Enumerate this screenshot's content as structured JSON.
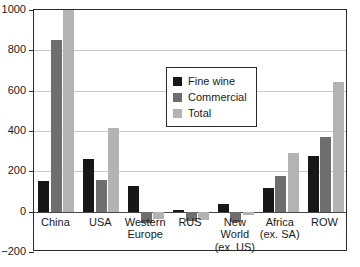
{
  "chart_data": {
    "type": "bar",
    "title": "",
    "subtitle": "",
    "xlabel": "",
    "ylabel": "",
    "ylim": [
      -200,
      1000
    ],
    "yticks": [
      1000,
      800,
      600,
      400,
      200,
      0,
      -200
    ],
    "ytick_labels": [
      "1000",
      "800",
      "600",
      "400",
      "200",
      "0",
      "−200"
    ],
    "grid": true,
    "grid_axis": "y",
    "legend_position": "upper center",
    "categories": [
      "China",
      "USA",
      "Western\nEurope",
      "RUS",
      "New\nWorld\n(ex. US)",
      "Africa\n(ex. SA)",
      "ROW"
    ],
    "series": [
      {
        "name": "Fine wine",
        "color": "#171717",
        "values": [
          150,
          260,
          125,
          10,
          40,
          115,
          275
        ]
      },
      {
        "name": "Commercial",
        "color": "#6e6e6e",
        "values": [
          850,
          155,
          -55,
          -45,
          -50,
          175,
          370
        ]
      },
      {
        "name": "Total",
        "color": "#b3b3b3",
        "values": [
          1000,
          415,
          -35,
          -40,
          -15,
          290,
          645
        ]
      }
    ]
  },
  "legend": {
    "items": [
      {
        "label": "Fine wine",
        "swatch": "fine"
      },
      {
        "label": "Commercial",
        "swatch": "comm"
      },
      {
        "label": "Total",
        "swatch": "total"
      }
    ]
  },
  "colors": {
    "fine_wine": "#171717",
    "commercial": "#6e6e6e",
    "total": "#b3b3b3",
    "axis": "#2b2b2b",
    "grid": "#c9c9c9",
    "zero_line": "#4a4a4a",
    "background": "#ffffff"
  }
}
